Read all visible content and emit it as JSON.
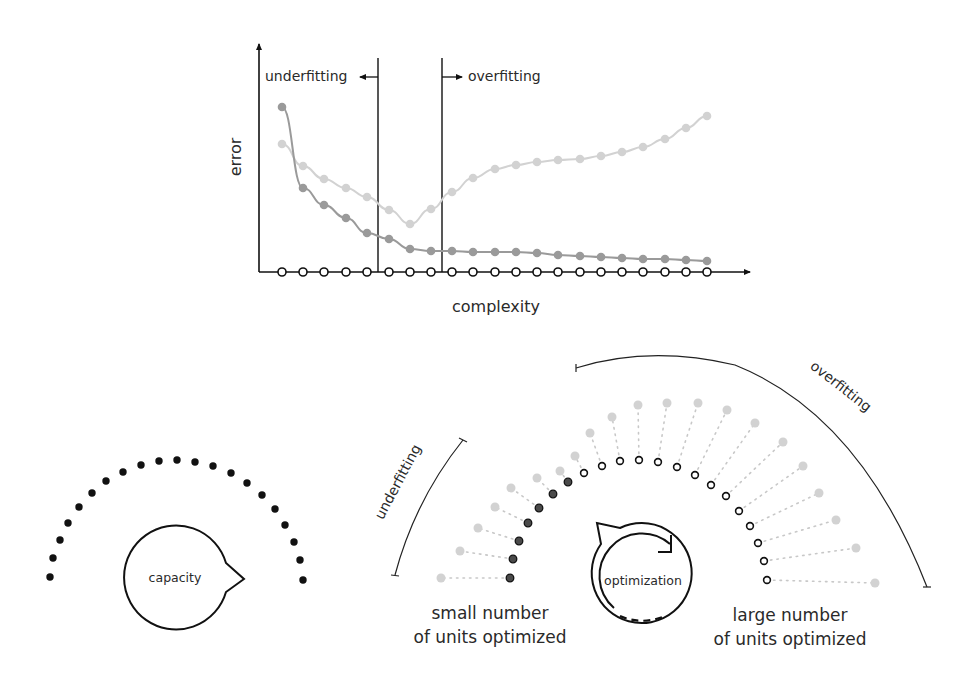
{
  "colors": {
    "axis": "#1a1a1a",
    "train": "#9a9a9a",
    "test": "#d2d2d2",
    "dark_dot": "#4a4a4a",
    "ink": "#111111"
  },
  "top_chart": {
    "y_label": "error",
    "x_label": "complexity",
    "underfitting_label": "underfitting",
    "overfitting_label": "overfitting"
  },
  "chart_data": {
    "type": "line",
    "title": "",
    "xlabel": "complexity",
    "ylabel": "error",
    "grid": false,
    "legend": "none",
    "x": [
      1,
      2,
      3,
      4,
      5,
      6,
      7,
      8,
      9,
      10,
      11,
      12,
      13,
      14,
      15,
      16,
      17,
      18,
      19,
      20,
      21
    ],
    "series": [
      {
        "name": "training error (dark gray)",
        "values": [
          0.93,
          0.48,
          0.39,
          0.31,
          0.22,
          0.19,
          0.13,
          0.12,
          0.12,
          0.11,
          0.11,
          0.11,
          0.11,
          0.1,
          0.09,
          0.09,
          0.09,
          0.08,
          0.08,
          0.07,
          0.06
        ]
      },
      {
        "name": "test error (light gray)",
        "values": [
          0.72,
          0.6,
          0.52,
          0.47,
          0.42,
          0.35,
          0.27,
          0.36,
          0.45,
          0.53,
          0.58,
          0.6,
          0.62,
          0.63,
          0.63,
          0.65,
          0.67,
          0.72,
          0.76,
          0.82,
          0.9
        ]
      },
      {
        "name": "baseline (open circles)",
        "values": [
          0,
          0,
          0,
          0,
          0,
          0,
          0,
          0,
          0,
          0,
          0,
          0,
          0,
          0,
          0,
          0,
          0,
          0,
          0,
          0,
          0
        ]
      }
    ],
    "annotations": [
      {
        "text": "underfitting",
        "arrow": "left",
        "boundary_x": 5.5
      },
      {
        "text": "overfitting",
        "arrow": "right",
        "boundary_x": 8.5
      }
    ],
    "ylim": [
      0,
      1
    ]
  },
  "bottom_left": {
    "bubble_label": "capacity",
    "dot_count": 21
  },
  "bottom_right": {
    "underfitting_label": "underfitting",
    "overfitting_label": "overfitting",
    "bubble_label": "optimization",
    "left_caption_line1": "small number",
    "left_caption_line2": "of units optimized",
    "right_caption_line1": "large number",
    "right_caption_line2": "of units optimized",
    "optimized_units_dark": 7,
    "total_units": 21
  },
  "geometry": {
    "top_x": [
      282,
      303,
      324,
      346,
      367,
      389,
      410,
      431,
      452,
      473,
      495,
      516,
      537,
      558,
      580,
      601,
      622,
      643,
      665,
      686,
      707
    ],
    "train_y": [
      107,
      188,
      205,
      218,
      233,
      239,
      249,
      251,
      251,
      252,
      252,
      252,
      253,
      255,
      256,
      257,
      258,
      259,
      259,
      260,
      261
    ],
    "test_y": [
      144,
      166,
      179,
      188,
      197,
      210,
      224,
      209,
      192,
      178,
      169,
      165,
      162,
      160,
      159,
      156,
      152,
      147,
      139,
      128,
      116
    ],
    "axis_y": 272,
    "cap_dots": [
      [
        50,
        577
      ],
      [
        53,
        558
      ],
      [
        60,
        540
      ],
      [
        68,
        523
      ],
      [
        79,
        507
      ],
      [
        92,
        493
      ],
      [
        106,
        481
      ],
      [
        123,
        472
      ],
      [
        141,
        465
      ],
      [
        159,
        461
      ],
      [
        177,
        460
      ],
      [
        195,
        462
      ],
      [
        213,
        466
      ],
      [
        231,
        473
      ],
      [
        247,
        483
      ],
      [
        262,
        495
      ],
      [
        275,
        509
      ],
      [
        285,
        525
      ],
      [
        294,
        542
      ],
      [
        300,
        560
      ],
      [
        303,
        580
      ]
    ],
    "inner": [
      [
        510,
        578
      ],
      [
        513,
        559
      ],
      [
        519,
        541
      ],
      [
        528,
        523
      ],
      [
        539,
        508
      ],
      [
        553,
        494
      ],
      [
        568,
        482
      ],
      [
        584,
        473
      ],
      [
        602,
        466
      ],
      [
        620,
        461
      ],
      [
        639,
        460
      ],
      [
        658,
        462
      ],
      [
        677,
        467
      ],
      [
        695,
        475
      ],
      [
        711,
        485
      ],
      [
        726,
        496
      ],
      [
        739,
        511
      ],
      [
        750,
        526
      ],
      [
        758,
        543
      ],
      [
        764,
        561
      ],
      [
        767,
        580
      ]
    ],
    "outer": [
      [
        441,
        578
      ],
      [
        460,
        551
      ],
      [
        478,
        528
      ],
      [
        495,
        507
      ],
      [
        511,
        488
      ],
      [
        537,
        478
      ],
      [
        560,
        471
      ],
      [
        575,
        456
      ],
      [
        590,
        433
      ],
      [
        612,
        417
      ],
      [
        638,
        405
      ],
      [
        667,
        403
      ],
      [
        698,
        403
      ],
      [
        727,
        410
      ],
      [
        755,
        423
      ],
      [
        783,
        442
      ],
      [
        803,
        466
      ],
      [
        819,
        493
      ],
      [
        836,
        520
      ],
      [
        856,
        548
      ],
      [
        875,
        583
      ]
    ]
  }
}
